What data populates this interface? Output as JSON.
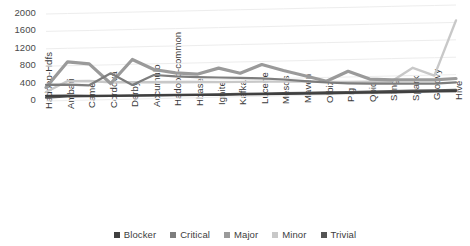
{
  "chart_data": {
    "type": "line",
    "title": "",
    "subtitle": "",
    "xlabel": "",
    "ylabel": "",
    "ylim": [
      0,
      2000
    ],
    "ytick_labels": [
      "2000",
      "1600",
      "1200",
      "800",
      "400",
      "0"
    ],
    "ytick_values": [
      2000,
      1600,
      1200,
      800,
      400,
      0
    ],
    "grid": true,
    "three_d": true,
    "legend_position": "bottom",
    "categories": [
      "Hadoop-Hdfs",
      "Ambari",
      "Camel",
      "Cordova",
      "Derby",
      "Accumulo",
      "Hadoop-common",
      "Hbase",
      "Ignite",
      "Kafka",
      "Lucene",
      "Mesos",
      "Maven",
      "Ofbiz",
      "Pig",
      "Qpid",
      "Sling",
      "Spark",
      "Groovy",
      "Hive"
    ],
    "series": [
      {
        "name": "Blocker",
        "color": "#3f3f3f",
        "values": [
          120,
          110,
          95,
          88,
          80,
          74,
          68,
          62,
          56,
          52,
          48,
          44,
          40,
          36,
          32,
          28,
          26,
          24,
          22,
          20
        ]
      },
      {
        "name": "Critical",
        "color": "#7d7d7d",
        "values": [
          300,
          290,
          265,
          530,
          250,
          470,
          430,
          400,
          380,
          360,
          340,
          300,
          250,
          210,
          180,
          160,
          150,
          140,
          130,
          150
        ]
      },
      {
        "name": "Major",
        "color": "#9a9a9a",
        "values": [
          200,
          780,
          720,
          260,
          800,
          560,
          470,
          430,
          560,
          430,
          620,
          470,
          340,
          200,
          420,
          230,
          200,
          190,
          180,
          200
        ]
      },
      {
        "name": "Minor",
        "color": "#c8c8c8",
        "values": [
          60,
          300,
          290,
          250,
          240,
          230,
          220,
          210,
          200,
          195,
          190,
          180,
          170,
          150,
          140,
          130,
          125,
          430,
          240,
          1500
        ]
      },
      {
        "name": "Trivial",
        "color": "#545454",
        "values": [
          40,
          60,
          55,
          50,
          46,
          42,
          38,
          34,
          30,
          28,
          26,
          24,
          22,
          20,
          18,
          16,
          15,
          14,
          13,
          12
        ]
      }
    ]
  },
  "legend": {
    "items": [
      {
        "label": "Blocker",
        "color": "#3f3f3f"
      },
      {
        "label": "Critical",
        "color": "#7d7d7d"
      },
      {
        "label": "Major",
        "color": "#9a9a9a"
      },
      {
        "label": "Minor",
        "color": "#c8c8c8"
      },
      {
        "label": "Trivial",
        "color": "#545454"
      }
    ]
  },
  "style": {
    "background": "#ffffff",
    "grid_color": "#ededed",
    "wall_color": "#fbfbfb",
    "text_color": "#3d3d3d"
  }
}
